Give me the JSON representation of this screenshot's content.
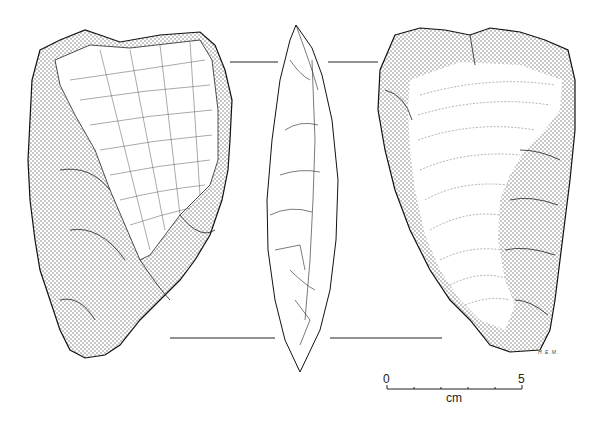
{
  "figure": {
    "views": [
      {
        "id": "dorsal",
        "label": "dorsal face"
      },
      {
        "id": "profile",
        "label": "lateral profile"
      },
      {
        "id": "ventral",
        "label": "ventral face"
      }
    ],
    "signature": "H.E.M.",
    "scale_bar": {
      "start_label": "0",
      "end_label": "5",
      "unit_label": "cm",
      "ticks": 6
    },
    "colors": {
      "ink": "#1a1a1a",
      "paper": "#ffffff"
    }
  }
}
